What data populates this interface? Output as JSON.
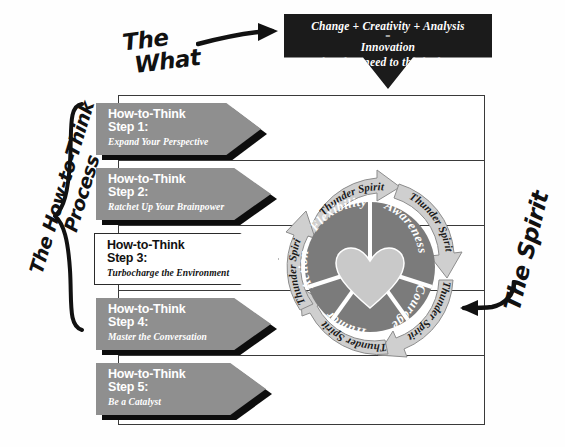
{
  "banner": {
    "line1": "Change + Creativity + Analysis",
    "line2": "=",
    "line3": "Innovation",
    "line4": "What do I need to think about?"
  },
  "annotations": {
    "what_line1": "The",
    "what_line2": "What",
    "process_line1": "The How-to-Think",
    "process_line2": "Process",
    "spirit": "The Spirit"
  },
  "steps": [
    {
      "title": "How-to-Think",
      "step": "Step 1:",
      "subtitle": "Expand Your Perspective",
      "highlighted": false
    },
    {
      "title": "How-to-Think",
      "step": "Step 2:",
      "subtitle": "Ratchet Up Your Brainpower",
      "highlighted": false
    },
    {
      "title": "How-to-Think",
      "step": "Step 3:",
      "subtitle": "Turbocharge the Environment",
      "highlighted": true
    },
    {
      "title": "How-to-Think",
      "step": "Step 4:",
      "subtitle": "Master the Conversation",
      "highlighted": false
    },
    {
      "title": "How-to-Think",
      "step": "Step 5:",
      "subtitle": "Be a Catalyst",
      "highlighted": false
    }
  ],
  "wheel": {
    "center_icon": "heart-icon",
    "segments": [
      {
        "label": "Awareness"
      },
      {
        "label": "Courage"
      },
      {
        "label": "Humor"
      },
      {
        "label": "Action"
      },
      {
        "label": "Flexibility"
      }
    ],
    "outer_arrows": [
      {
        "label": "Thunder Spirit"
      },
      {
        "label": "Thunder Spirit"
      },
      {
        "label": "Thunder Spirit"
      },
      {
        "label": "Thunder Spirit"
      },
      {
        "label": "Thunder Spirit"
      }
    ]
  },
  "colors": {
    "banner_bg": "#1b1b1b",
    "arrow_gray": "#8f8f8f",
    "arrow_shadow": "#0d0d0d",
    "wheel_segment": "#7b7b7b",
    "wheel_heart": "#c9c9c9",
    "thunder_arrow": "#cfcfcf",
    "frame_line": "#3a3a3a",
    "paper": "#ffffff"
  }
}
